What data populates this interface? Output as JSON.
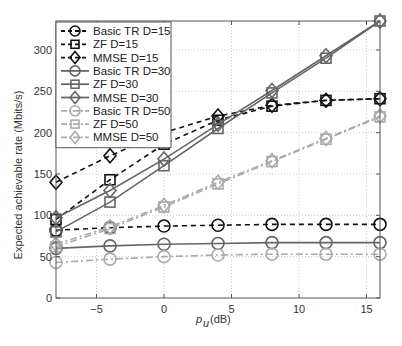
{
  "chart_data": {
    "type": "line",
    "title": "",
    "xlabel": "p_u (dB)",
    "ylabel": "Expected achievable rate (Mbits/s)",
    "xlim": [
      -8,
      16
    ],
    "ylim": [
      0,
      335
    ],
    "xticks": [
      -5,
      0,
      5,
      10,
      15
    ],
    "yticks": [
      0,
      50,
      100,
      150,
      200,
      250,
      300
    ],
    "grid": true,
    "legend_position": "upper-left",
    "x": [
      -8,
      -4,
      0,
      4,
      8,
      12,
      16
    ],
    "series": [
      {
        "name": "Basic TR D=15",
        "color": "#111111",
        "line": "dashed",
        "marker": "circle",
        "values": [
          82,
          85,
          87,
          88,
          89,
          89,
          89
        ]
      },
      {
        "name": "ZF D=15",
        "color": "#111111",
        "line": "dashed",
        "marker": "square",
        "values": [
          95,
          143,
          186,
          215,
          232,
          239,
          241
        ]
      },
      {
        "name": "MMSE D=15",
        "color": "#111111",
        "line": "dashed",
        "marker": "diamond",
        "values": [
          140,
          172,
          200,
          220,
          233,
          239,
          241
        ]
      },
      {
        "name": "Basic TR D=30",
        "color": "#666666",
        "line": "solid",
        "marker": "circle",
        "values": [
          60,
          63,
          65,
          66,
          67,
          67,
          67
        ]
      },
      {
        "name": "ZF D=30",
        "color": "#666666",
        "line": "solid",
        "marker": "square",
        "values": [
          80,
          116,
          160,
          205,
          248,
          290,
          335
        ]
      },
      {
        "name": "MMSE D=30",
        "color": "#666666",
        "line": "solid",
        "marker": "diamond",
        "values": [
          97,
          130,
          168,
          210,
          251,
          293,
          335
        ]
      },
      {
        "name": "Basic TR D=50",
        "color": "#aaaaaa",
        "line": "dashdot",
        "marker": "circle",
        "values": [
          43,
          47,
          50,
          52,
          53,
          53,
          53
        ]
      },
      {
        "name": "ZF D=50",
        "color": "#aaaaaa",
        "line": "dashdot",
        "marker": "square",
        "values": [
          62,
          84,
          110,
          138,
          165,
          192,
          219
        ]
      },
      {
        "name": "MMSE D=50",
        "color": "#aaaaaa",
        "line": "dashdot",
        "marker": "diamond",
        "values": [
          65,
          86,
          112,
          140,
          166,
          193,
          220
        ]
      }
    ]
  },
  "axes": {
    "xlabel_main": "p",
    "xlabel_sub": "u",
    "xlabel_unit": "(dB)",
    "ylabel": "Expected achievable rate (Mbits/s)"
  }
}
